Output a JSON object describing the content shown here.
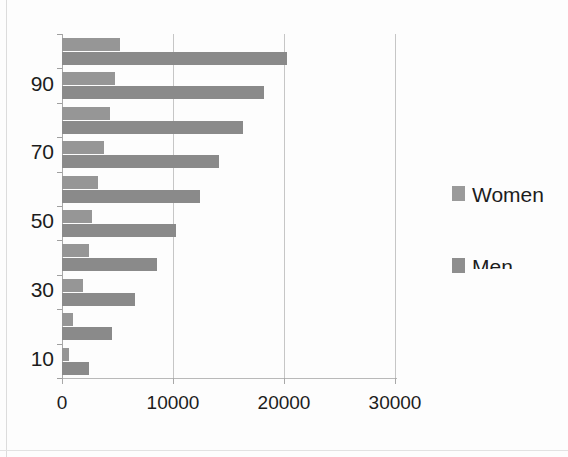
{
  "chart_data": {
    "type": "bar",
    "orientation": "horizontal",
    "title": "",
    "subtitle": "",
    "xlabel": "",
    "ylabel": "",
    "xlim": [
      0,
      30000
    ],
    "ylim": [
      0,
      100
    ],
    "grid": true,
    "grid_axis": "x",
    "legend_position": "right",
    "categories": [
      "100",
      "90",
      "80",
      "70",
      "60",
      "50",
      "40",
      "30",
      "20",
      "10"
    ],
    "y_tick_labels": [
      "90",
      "70",
      "50",
      "30",
      "10"
    ],
    "x_tick_labels": [
      "0",
      "10000",
      "20000",
      "30000"
    ],
    "x_tick_values": [
      0,
      10000,
      20000,
      30000
    ],
    "series": [
      {
        "name": "Women",
        "color": "#969696",
        "values": [
          5200,
          4800,
          4300,
          3800,
          3200,
          2700,
          2400,
          1900,
          1000,
          600
        ]
      },
      {
        "name": "Men",
        "color": "#8a8a8a",
        "values": [
          20300,
          18200,
          16300,
          14100,
          12400,
          10300,
          8600,
          6600,
          4500,
          2400
        ]
      }
    ]
  },
  "legend": {
    "entries": [
      {
        "label": "Women",
        "swatch": "legend-swatch-women"
      },
      {
        "label": "Men",
        "swatch": "legend-swatch-men"
      }
    ]
  },
  "axes": {
    "x_ticks": [
      {
        "label": "0",
        "value": 0
      },
      {
        "label": "10000",
        "value": 10000
      },
      {
        "label": "20000",
        "value": 20000
      },
      {
        "label": "30000",
        "value": 30000
      }
    ],
    "y_ticks": [
      {
        "label": "90",
        "index": 1
      },
      {
        "label": "70",
        "index": 3
      },
      {
        "label": "50",
        "index": 5
      },
      {
        "label": "30",
        "index": 7
      },
      {
        "label": "10",
        "index": 9
      }
    ]
  }
}
